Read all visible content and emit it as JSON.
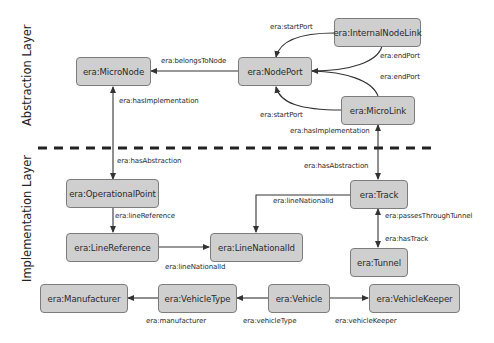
{
  "layers": {
    "abstraction": "Abstraction Layer",
    "implementation": "Implementation Layer"
  },
  "nodes": {
    "micro_node": "era:MicroNode",
    "node_port": "era:NodePort",
    "internal_node_link": "era:InternalNodeLink",
    "micro_link": "era:MicroLink",
    "operational_point": "era:OperationalPoint",
    "line_reference": "era:LineReference",
    "line_national_id": "era:LineNationalId",
    "track": "era:Track",
    "tunnel": "era:Tunnel",
    "manufacturer": "era:Manufacturer",
    "vehicle_type": "era:VehicleType",
    "vehicle": "era:Vehicle",
    "vehicle_keeper": "era:VehicleKeeper"
  },
  "edges": {
    "belongs_to_node": "era:belongsToNode",
    "inl_start_port": "era:startPort",
    "inl_end_port": "era:endPort",
    "ml_end_port": "era:endPort",
    "ml_start_port": "era:startPort",
    "micronode_has_implementation": "era:hasImplementation",
    "op_has_abstraction": "era:hasAbstraction",
    "microlink_has_implementation": "era:hasImplementation",
    "track_has_abstraction": "era:hasAbstraction",
    "line_reference": "era:lineReference",
    "lr_line_national_id": "era:lineNationalId",
    "track_line_national_id": "era:lineNationalId",
    "passes_through_tunnel": "era:passesThroughTunnel",
    "has_track": "era:hasTrack",
    "manufacturer": "era:manufacturer",
    "vehicle_type": "era:vehicleType",
    "vehicle_keeper": "era:vehicleKeeper"
  },
  "colors": {
    "node_fill": "#cfcfcf",
    "node_border": "#7c7c7c",
    "edge": "#333333",
    "separator": "#222222"
  }
}
